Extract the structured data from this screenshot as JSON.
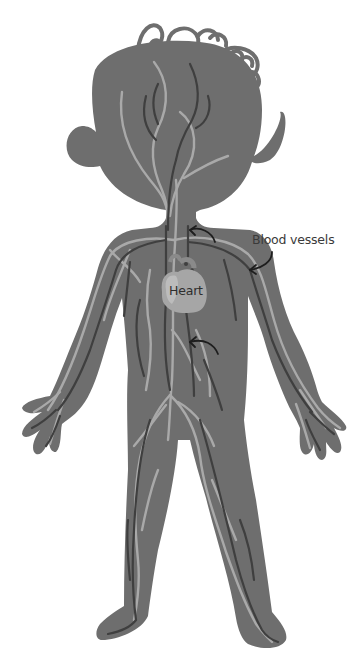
{
  "diagram": {
    "labels": {
      "blood_vessels": "Blood vessels",
      "heart": "Heart"
    },
    "colors": {
      "background": "#ffffff",
      "body": "#6e6e6e",
      "arteries_light": "#a9a9a9",
      "veins_dark": "#3f3f3f",
      "heart": "#a6a6a6",
      "heart_highlight": "#bcbcbc",
      "arrows": "#1e1e1e",
      "hair_outline": "#6e6e6e"
    },
    "annotations": [
      {
        "type": "arrow",
        "target": "blood-vessel-upper",
        "direction": "curved-left"
      },
      {
        "type": "arrow",
        "target": "blood-vessel-lower",
        "direction": "curved-left"
      },
      {
        "type": "pointer",
        "from": "blood-vessels-label",
        "to": "left-arm-vessel"
      }
    ]
  }
}
